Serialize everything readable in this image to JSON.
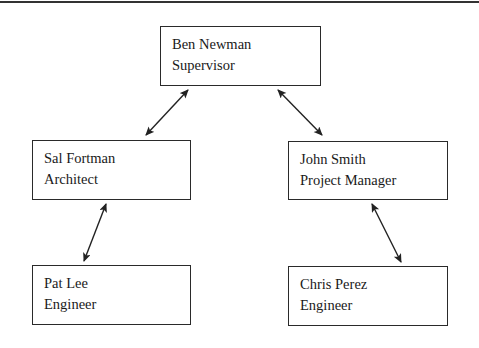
{
  "diagram": {
    "type": "org-chart",
    "nodes": [
      {
        "id": "ben",
        "name": "Ben Newman",
        "role": "Supervisor"
      },
      {
        "id": "sal",
        "name": "Sal Fortman",
        "role": "Architect"
      },
      {
        "id": "john",
        "name": "John Smith",
        "role": "Project Manager"
      },
      {
        "id": "pat",
        "name": "Pat Lee",
        "role": "Engineer"
      },
      {
        "id": "chris",
        "name": "Chris Perez",
        "role": "Engineer"
      }
    ],
    "edges": [
      {
        "from": "ben",
        "to": "sal",
        "style": "double-arrow"
      },
      {
        "from": "ben",
        "to": "john",
        "style": "double-arrow"
      },
      {
        "from": "sal",
        "to": "pat",
        "style": "double-arrow"
      },
      {
        "from": "john",
        "to": "chris",
        "style": "double-arrow"
      }
    ]
  },
  "colors": {
    "line": "#222222",
    "border": "#2a2a2a",
    "background": "#ffffff"
  }
}
